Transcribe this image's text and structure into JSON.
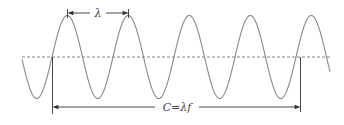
{
  "diagram": {
    "type": "sine-wave-wavelength",
    "wavelength_label": "λ",
    "speed_label": "C=λf",
    "colors": {
      "wave": "#8a8a8a",
      "axis": "#666666",
      "annotation": "#333333",
      "background": "#ffffff"
    },
    "cycles_shown": 5
  }
}
